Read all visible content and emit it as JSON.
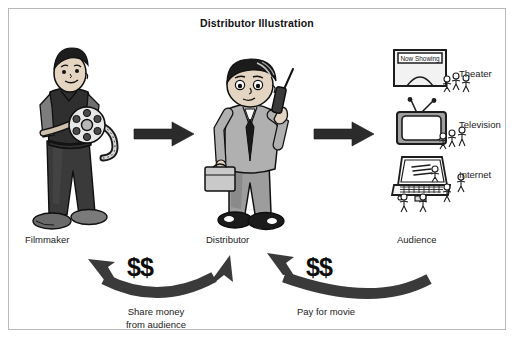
{
  "panel": {
    "title": "Distributor Illustration",
    "border_color": "#b8b8b8",
    "background": "#ffffff"
  },
  "actors": [
    {
      "id": "filmmaker",
      "label": "Filmmaker",
      "icon": "filmmaker-with-film-reel"
    },
    {
      "id": "distributor",
      "label": "Distributor",
      "icon": "businessman-on-phone-with-briefcase"
    },
    {
      "id": "audience",
      "label": "Audience",
      "icon": "audience-stick-figures"
    }
  ],
  "channels": [
    {
      "id": "theater",
      "label": "Theater",
      "icon": "movie-theater-icon",
      "marquee": "Now Showing"
    },
    {
      "id": "television",
      "label": "Television",
      "icon": "television-icon"
    },
    {
      "id": "internet",
      "label": "Internet",
      "icon": "laptop-icon"
    }
  ],
  "flow_arrows": [
    {
      "id": "filmmaker-to-distributor",
      "direction": "right",
      "style": "straight-black"
    },
    {
      "id": "distributor-to-audience",
      "direction": "right",
      "style": "straight-black"
    }
  ],
  "money_flows": [
    {
      "id": "share-money",
      "amount_symbol": "$$",
      "caption": "Share money\nfrom audience",
      "direction": "distributor-to-filmmaker",
      "style": "curved-arrow"
    },
    {
      "id": "pay-for-movie",
      "amount_symbol": "$$",
      "caption": "Pay for movie",
      "direction": "audience-to-distributor",
      "style": "curved-arrow"
    }
  ],
  "colors": {
    "ink": "#111111",
    "arrow": "#2b2b2b",
    "curve_arrow": "#3a3a3a",
    "skin": "#e9d9c9",
    "suit": "#a9a9a9",
    "dark_cloth": "#3b3b3b",
    "device_gray": "#9a9a9a",
    "screen": "#ffffff"
  }
}
